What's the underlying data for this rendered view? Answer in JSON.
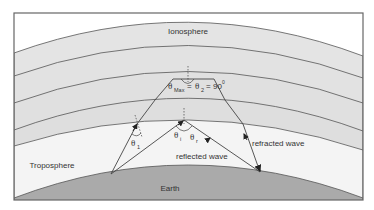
{
  "diagram": {
    "layers": {
      "ionosphere": "Ionosphere",
      "troposphere": "Troposphere",
      "earth": "Earth"
    },
    "labels": {
      "theta_max": "θ",
      "theta_max_sub": "Max",
      "equals1": "=",
      "theta_2": "θ",
      "theta_2_sub": "2",
      "equals2": "=",
      "ninety": "90",
      "degree": "0",
      "theta_1_left": "θ",
      "theta_1_left_sub": "1",
      "theta_i": "θ",
      "theta_i_sub": "i",
      "theta_r": "θ",
      "theta_r_sub": "r",
      "reflected_wave": "reflected wave",
      "refracted_wave": "refracted wave"
    },
    "colors": {
      "frame": "#666666",
      "ionosphere_band": "#e4e4e4",
      "band_line": "#555555",
      "troposphere": "#f4f4f4",
      "earth": "#aaaaaa",
      "ray": "#444444",
      "background": "#ffffff"
    }
  }
}
